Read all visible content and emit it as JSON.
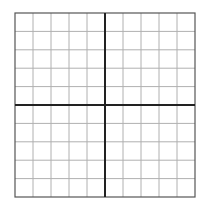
{
  "grid": {
    "columns": 10,
    "rows": 10,
    "left": 15,
    "top": 13,
    "width": 180,
    "height": 184,
    "gridline_color": "#b0b0b0",
    "border_color": "#555555",
    "axis_color": "#222222",
    "axis_column": 5,
    "axis_row": 5
  }
}
